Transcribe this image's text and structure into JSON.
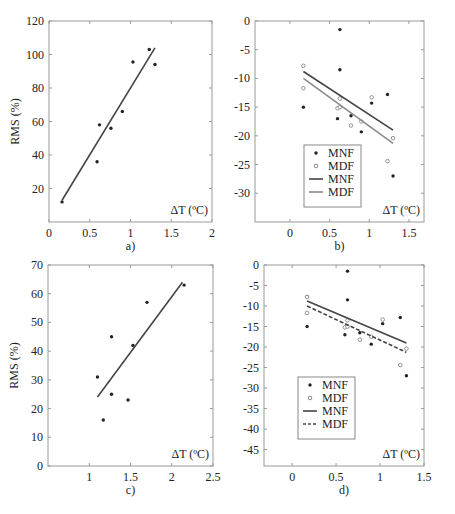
{
  "chart_data": [
    {
      "panel": "a)",
      "type": "scatter",
      "xlabel": "ΔT (ºC)",
      "ylabel": "RMS (%)",
      "xlim": [
        0,
        2
      ],
      "ylim": [
        0,
        120
      ],
      "xticks": [
        0,
        0.5,
        1,
        1.5,
        2
      ],
      "xtick_labels": [
        "0",
        "0.5",
        "1",
        "1.5",
        "2"
      ],
      "yticks": [
        20,
        40,
        60,
        80,
        100,
        120
      ],
      "ytick_labels": [
        "20",
        "40",
        "60",
        "80",
        "100",
        "120"
      ],
      "grid": false,
      "series": [
        {
          "name": "data",
          "kind": "points",
          "x": [
            0.16,
            0.59,
            0.62,
            0.76,
            0.9,
            1.03,
            1.23,
            1.3
          ],
          "y": [
            12,
            36,
            58,
            56,
            66,
            95.5,
            103,
            94
          ]
        },
        {
          "name": "fit",
          "kind": "line",
          "x": [
            0.16,
            1.3
          ],
          "y": [
            13,
            104
          ]
        }
      ]
    },
    {
      "panel": "b)",
      "type": "scatter",
      "xlabel": "ΔT (ºC)",
      "ylabel": "",
      "xlim": [
        -0.44,
        1.69
      ],
      "ylim": [
        -35,
        0
      ],
      "xticks": [
        0,
        0.5,
        1,
        1.5
      ],
      "xtick_labels": [
        "0",
        "0.5",
        "1",
        "1.5"
      ],
      "yticks": [
        0,
        -5,
        -10,
        -15,
        -20,
        -25,
        -30
      ],
      "ytick_labels": [
        "0",
        "-5",
        "-10",
        "-15",
        "-20",
        "-25",
        "-30"
      ],
      "grid": false,
      "legend": [
        "MNF",
        "MDF",
        "MNF",
        "MDF"
      ],
      "legend_position": "lower left",
      "series": [
        {
          "name": "MNF",
          "kind": "points",
          "marker": "filled",
          "x": [
            0.17,
            0.6,
            0.63,
            0.63,
            0.77,
            0.9,
            1.03,
            1.23,
            1.3
          ],
          "y": [
            -15,
            -17,
            -1.5,
            -8.5,
            -16.5,
            -19.3,
            -14.3,
            -12.8,
            -27
          ]
        },
        {
          "name": "MDF",
          "kind": "points",
          "marker": "open",
          "x": [
            0.17,
            0.17,
            0.6,
            0.63,
            0.63,
            0.77,
            0.9,
            1.03,
            1.23,
            1.3
          ],
          "y": [
            -7.8,
            -11.7,
            -15.2,
            -13.5,
            -15,
            -18.2,
            -17.5,
            -13.3,
            -24.4,
            -20.4
          ]
        },
        {
          "name": "MNF",
          "kind": "line",
          "style": "solid",
          "x": [
            0.17,
            1.3
          ],
          "y": [
            -8.8,
            -19
          ]
        },
        {
          "name": "MDF",
          "kind": "line",
          "style": "dashdot",
          "x": [
            0.17,
            1.3
          ],
          "y": [
            -10,
            -21.3
          ]
        }
      ]
    },
    {
      "panel": "c)",
      "type": "scatter",
      "xlabel": "ΔT (ºC)",
      "ylabel": "RMS (%)",
      "xlim": [
        0.5,
        2.5
      ],
      "ylim": [
        0,
        70
      ],
      "xticks": [
        1,
        1.5,
        2,
        2.5
      ],
      "xtick_labels": [
        "1",
        "1.5",
        "2",
        "2.5"
      ],
      "yticks": [
        0,
        10,
        20,
        30,
        40,
        50,
        60,
        70
      ],
      "ytick_labels": [
        "0",
        "10",
        "20",
        "30",
        "40",
        "50",
        "60",
        "70"
      ],
      "grid": false,
      "series": [
        {
          "name": "data",
          "kind": "points",
          "x": [
            1.1,
            1.17,
            1.27,
            1.27,
            1.47,
            1.53,
            1.7,
            2.15
          ],
          "y": [
            31,
            16,
            45,
            25,
            23,
            42,
            57,
            63
          ]
        },
        {
          "name": "fit",
          "kind": "line",
          "x": [
            1.1,
            2.13
          ],
          "y": [
            24,
            64
          ]
        }
      ]
    },
    {
      "panel": "d)",
      "type": "scatter",
      "xlabel": "ΔT (ºC)",
      "ylabel": "",
      "xlim": [
        -0.32,
        1.5
      ],
      "ylim": [
        -49,
        0
      ],
      "xticks": [
        0,
        0.5,
        1,
        1.5
      ],
      "xtick_labels": [
        "0",
        "0.5",
        "1",
        "1.5"
      ],
      "yticks": [
        0,
        -5,
        -10,
        -15,
        -20,
        -25,
        -30,
        -35,
        -40,
        -45
      ],
      "ytick_labels": [
        "0",
        "-5",
        "-10",
        "-15",
        "-20",
        "-25",
        "-30",
        "-35",
        "-40",
        "-45"
      ],
      "grid": false,
      "legend": [
        "MNF",
        "MDF",
        "MNF",
        "MDF"
      ],
      "legend_position": "lower left",
      "series": [
        {
          "name": "MNF",
          "kind": "points",
          "marker": "filled",
          "x": [
            0.17,
            0.17,
            0.6,
            0.63,
            0.63,
            0.77,
            0.9,
            1.03,
            1.23,
            1.3
          ],
          "y": [
            -15,
            -7.7,
            -17,
            -1.5,
            -8.5,
            -16.5,
            -19.3,
            -14.3,
            -12.8,
            -27
          ]
        },
        {
          "name": "MDF",
          "kind": "points",
          "marker": "open",
          "x": [
            0.17,
            0.17,
            0.6,
            0.63,
            0.63,
            0.77,
            0.9,
            1.03,
            1.23,
            1.3
          ],
          "y": [
            -7.8,
            -11.7,
            -15.2,
            -13.5,
            -15,
            -18.2,
            -17.5,
            -13.3,
            -24.4,
            -20.4
          ]
        },
        {
          "name": "MNF",
          "kind": "line",
          "style": "solid",
          "x": [
            0.17,
            1.3
          ],
          "y": [
            -8.8,
            -19
          ]
        },
        {
          "name": "MDF",
          "kind": "line",
          "style": "dashed",
          "x": [
            0.17,
            1.3
          ],
          "y": [
            -10,
            -21.3
          ]
        }
      ]
    }
  ],
  "layout": {
    "panels": [
      {
        "box": [
          49,
          21,
          212,
          222
        ],
        "caption_y": 250
      },
      {
        "box": [
          255,
          21,
          424,
          222
        ],
        "caption_y": 250
      },
      {
        "box": [
          48,
          265,
          213,
          466
        ],
        "caption_y": 494
      },
      {
        "box": [
          264,
          265,
          424,
          466
        ],
        "caption_y": 494
      }
    ]
  }
}
